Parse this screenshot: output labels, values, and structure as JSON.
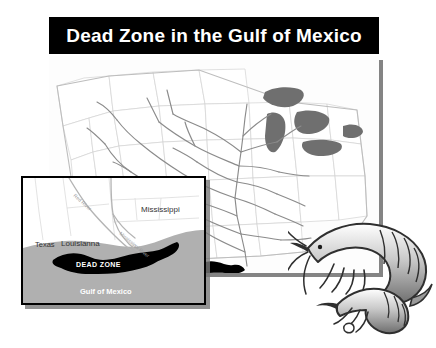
{
  "page": {
    "background_color": "#ffffff",
    "width": 436,
    "height": 348
  },
  "header": {
    "title": "Dead Zone in the Gulf of Mexico",
    "background_color": "#000000",
    "text_color": "#ffffff"
  },
  "main_map": {
    "name": "united-states-watershed-map",
    "description": "Map of the continental United States showing the Mississippi River drainage basin, state outlines and the Great Lakes",
    "land_color": "#fdfdfd",
    "state_border_color": "#c9c9c9",
    "river_color": "#8d8d8d",
    "lake_color": "#6f6f6f",
    "dead_zone_color": "#000000",
    "dead_zone_label": "DEAD ZONE"
  },
  "inset_map": {
    "name": "gulf-coast-inset",
    "border_color": "#000000",
    "water_color": "#b0b0b0",
    "land_color": "#ffffff",
    "dead_zone_color": "#000000",
    "labels": {
      "texas": "Texas",
      "louisianna": "Louisianna",
      "mississippi": "Mississippi",
      "red_river": "Red River",
      "mississippi_river": "Mississippi River",
      "dead_zone": "DEAD ZONE",
      "gulf_of_mexico": "Gulf of Mexico"
    }
  },
  "illustration": {
    "name": "shrimp-illustration",
    "description": "Grayscale ink drawing of two shrimp overlapping the lower right corner of the map",
    "color": "#3a3a3a"
  }
}
